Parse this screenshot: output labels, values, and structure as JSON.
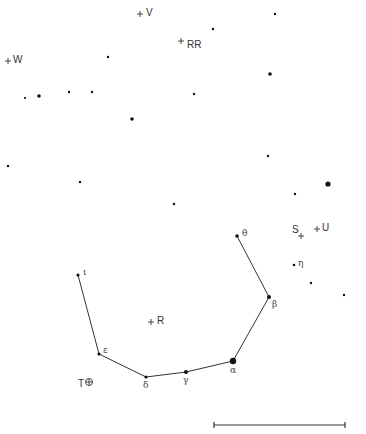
{
  "colors": {
    "background": "#ffffff",
    "ink": "#111111",
    "line": "#333333"
  },
  "field_stars": [
    {
      "x": 275,
      "y": 14,
      "r": 1.2
    },
    {
      "x": 213,
      "y": 29,
      "r": 1.2
    },
    {
      "x": 108,
      "y": 57,
      "r": 1.2
    },
    {
      "x": 270,
      "y": 74,
      "r": 1.8
    },
    {
      "x": 25,
      "y": 98,
      "r": 1.1
    },
    {
      "x": 39,
      "y": 96,
      "r": 1.8
    },
    {
      "x": 69,
      "y": 92,
      "r": 1.2
    },
    {
      "x": 92,
      "y": 92,
      "r": 1.2
    },
    {
      "x": 194,
      "y": 94,
      "r": 1.2
    },
    {
      "x": 132,
      "y": 119,
      "r": 1.8
    },
    {
      "x": 8,
      "y": 166,
      "r": 1.2
    },
    {
      "x": 268,
      "y": 156,
      "r": 1.2
    },
    {
      "x": 80,
      "y": 182,
      "r": 1.2
    },
    {
      "x": 328,
      "y": 184,
      "r": 2.6
    },
    {
      "x": 295,
      "y": 194,
      "r": 1.2
    },
    {
      "x": 174,
      "y": 204,
      "r": 1.2
    },
    {
      "x": 311,
      "y": 283,
      "r": 1.2
    },
    {
      "x": 344,
      "y": 295,
      "r": 1.2
    }
  ],
  "constellation": {
    "stars": [
      {
        "id": "iota",
        "label": "ι",
        "x": 78,
        "y": 275,
        "r": 1.6,
        "lx": 5,
        "ly": -7
      },
      {
        "id": "epsilon",
        "label": "ε",
        "x": 99,
        "y": 354,
        "r": 1.6,
        "lx": 4,
        "ly": -8
      },
      {
        "id": "delta",
        "label": "δ",
        "x": 146,
        "y": 377,
        "r": 1.6,
        "lx": -3,
        "ly": 4
      },
      {
        "id": "gamma",
        "label": "γ",
        "x": 186,
        "y": 372,
        "r": 2.0,
        "lx": -3,
        "ly": 4
      },
      {
        "id": "alpha",
        "label": "α",
        "x": 233,
        "y": 361,
        "r": 3.2,
        "lx": -3,
        "ly": 5
      },
      {
        "id": "beta",
        "label": "β",
        "x": 269,
        "y": 297,
        "r": 2.0,
        "lx": 3,
        "ly": 3
      },
      {
        "id": "theta",
        "label": "θ",
        "x": 237,
        "y": 236,
        "r": 1.8,
        "lx": 5,
        "ly": -7
      }
    ],
    "path": [
      "iota",
      "epsilon",
      "delta",
      "gamma",
      "alpha",
      "beta",
      "theta"
    ],
    "extra": [
      {
        "id": "eta",
        "label": "η",
        "x": 294,
        "y": 265,
        "r": 1.3,
        "lx": 4,
        "ly": -6
      }
    ]
  },
  "variables": [
    {
      "id": "V",
      "label": "V",
      "marker": "+",
      "x": 140,
      "y": 14,
      "lx": 6,
      "ly": -6
    },
    {
      "id": "RR",
      "label": "RR",
      "marker": "+",
      "x": 181,
      "y": 41,
      "lx": 6,
      "ly": -1
    },
    {
      "id": "W",
      "label": "W",
      "marker": "+",
      "x": 8,
      "y": 61,
      "lx": 5,
      "ly": -6
    },
    {
      "id": "S",
      "label": "S",
      "marker": "+",
      "x": 301,
      "y": 236,
      "lx": -9,
      "ly": -11
    },
    {
      "id": "U",
      "label": "U",
      "marker": "+",
      "x": 317,
      "y": 229,
      "lx": 5,
      "ly": -6
    },
    {
      "id": "R",
      "label": "R",
      "marker": "+",
      "x": 151,
      "y": 322,
      "lx": 6,
      "ly": -6
    },
    {
      "id": "T",
      "label": "T",
      "marker": "⊕",
      "x": 89,
      "y": 382,
      "lx": -11,
      "ly": -3
    }
  ],
  "scale_bar": {
    "x1": 214,
    "x2": 345,
    "y": 425,
    "tick": 6
  }
}
